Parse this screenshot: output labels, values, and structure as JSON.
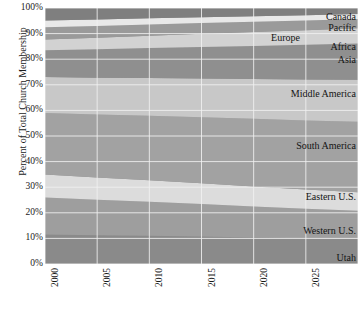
{
  "chart_data": {
    "type": "area",
    "stacked": true,
    "title": "",
    "xlabel": "",
    "ylabel": "Percent of Total Church Membership",
    "x": [
      2000,
      2005,
      2010,
      2015,
      2020,
      2025,
      2030
    ],
    "xlim": [
      2000,
      2030
    ],
    "ylim": [
      0,
      100
    ],
    "grid": true,
    "legend_position": "inline-right",
    "xtick_labels": [
      "2000",
      "2005",
      "2010",
      "2015",
      "2020",
      "2025",
      "2030"
    ],
    "ytick_labels": [
      "0%",
      "10%",
      "20%",
      "30%",
      "40%",
      "50%",
      "60%",
      "70%",
      "80%",
      "90%",
      "100%"
    ],
    "ytick_values": [
      0,
      10,
      20,
      30,
      40,
      50,
      60,
      70,
      80,
      90,
      100
    ],
    "series": [
      {
        "name": "Utah",
        "color": "#8a8a8a",
        "values": [
          11.5,
          11.2,
          11.0,
          10.7,
          10.4,
          10.1,
          9.8
        ]
      },
      {
        "name": "Western U.S.",
        "color": "#9e9e9e",
        "values": [
          14.5,
          13.9,
          13.3,
          12.7,
          12.1,
          11.5,
          11.0
        ]
      },
      {
        "name": "Eastern U.S.",
        "color": "#dcdcdc",
        "values": [
          9.0,
          8.7,
          8.4,
          8.1,
          7.8,
          7.5,
          7.2
        ]
      },
      {
        "name": "South America",
        "color": "#a2a2a2",
        "values": [
          24.0,
          24.6,
          25.2,
          25.8,
          26.4,
          27.0,
          27.6
        ]
      },
      {
        "name": "Middle America",
        "color": "#c8c8c8",
        "values": [
          14.0,
          14.4,
          14.8,
          15.2,
          15.6,
          16.0,
          16.4
        ]
      },
      {
        "name": "Asia",
        "color": "#8f8f8f",
        "values": [
          10.5,
          11.1,
          11.7,
          12.3,
          12.9,
          13.5,
          14.1
        ]
      },
      {
        "name": "Africa",
        "color": "#d2d2d2",
        "values": [
          4.2,
          4.5,
          4.8,
          5.1,
          5.4,
          5.7,
          6.0
        ]
      },
      {
        "name": "Europe",
        "color": "#9a9a9a",
        "values": [
          4.8,
          4.6,
          4.4,
          4.2,
          4.0,
          3.8,
          3.6
        ]
      },
      {
        "name": "Pacific",
        "color": "#e8e8e8",
        "values": [
          2.6,
          2.5,
          2.4,
          2.3,
          2.2,
          2.1,
          2.0
        ]
      },
      {
        "name": "Canada",
        "color": "#7f7f7f",
        "values": [
          4.9,
          4.5,
          4.0,
          3.6,
          3.2,
          2.8,
          2.3
        ]
      }
    ],
    "label_colors": {
      "gridline": "#f2f2f2",
      "text": "#1a1a1a",
      "background": "#ffffff"
    }
  }
}
